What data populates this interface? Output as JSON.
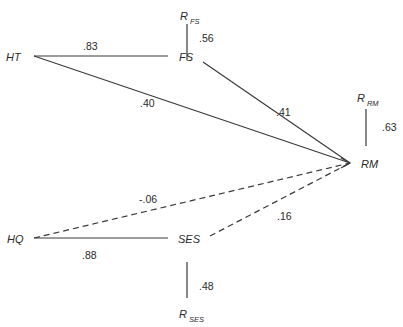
{
  "diagram": {
    "type": "path-diagram",
    "nodes": {
      "HT": {
        "label": "HT"
      },
      "FS": {
        "label": "FS"
      },
      "RM": {
        "label": "RM"
      },
      "HQ": {
        "label": "HQ"
      },
      "SES": {
        "label": "SES"
      },
      "R_FS": {
        "label": "R",
        "sub": "FS"
      },
      "R_RM": {
        "label": "R",
        "sub": "RM"
      },
      "R_SES": {
        "label": "R",
        "sub": "SES"
      }
    },
    "edges": [
      {
        "from": "HT",
        "to": "FS",
        "coef": ".83",
        "style": "solid"
      },
      {
        "from": "HT",
        "to": "RM",
        "coef": ".40",
        "style": "solid"
      },
      {
        "from": "FS",
        "to": "RM",
        "coef": ".41",
        "style": "solid"
      },
      {
        "from": "HQ",
        "to": "SES",
        "coef": ".88",
        "style": "solid"
      },
      {
        "from": "HQ",
        "to": "RM",
        "coef": "-.06",
        "style": "dashed"
      },
      {
        "from": "SES",
        "to": "RM",
        "coef": ".16",
        "style": "dashed"
      },
      {
        "from": "R_FS",
        "to": "FS",
        "coef": ".56",
        "style": "solid"
      },
      {
        "from": "R_RM",
        "to": "RM",
        "coef": ".63",
        "style": "solid"
      },
      {
        "from": "R_SES",
        "to": "SES",
        "coef": ".48",
        "style": "solid"
      }
    ],
    "line_color": "#3a3a3a"
  }
}
